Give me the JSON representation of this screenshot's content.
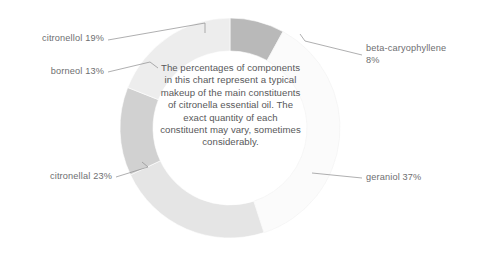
{
  "chart_data": {
    "type": "pie",
    "variant": "donut",
    "title": "",
    "subtitle": "",
    "xlabel": "",
    "ylabel": "",
    "legend_position": "callout-labels",
    "grid": false,
    "units": "%",
    "total": 100,
    "categories": [
      "beta-caryophyllene",
      "geraniol",
      "citronellal",
      "borneol",
      "citronellol"
    ],
    "values": [
      8,
      37,
      23,
      13,
      19
    ],
    "slices": [
      {
        "name": "beta-caryophyllene",
        "value": 8,
        "label": "beta-caryophyllene\n8%",
        "color": "#b9b9b9",
        "start_angle": 0,
        "end_angle": 28.8,
        "label_side": "right"
      },
      {
        "name": "geraniol",
        "value": 37,
        "label": "geraniol 37%",
        "color": "#fbfbfb",
        "start_angle": 28.8,
        "end_angle": 162,
        "label_side": "right"
      },
      {
        "name": "citronellal",
        "value": 23,
        "label": "citronellal 23%",
        "color": "#e5e5e5",
        "start_angle": 162,
        "end_angle": 244.8,
        "label_side": "left"
      },
      {
        "name": "borneol",
        "value": 13,
        "label": "borneol 13%",
        "color": "#d1d1d1",
        "start_angle": 244.8,
        "end_angle": 291.6,
        "label_side": "left"
      },
      {
        "name": "citronellol",
        "value": 19,
        "label": "citronellol 19%",
        "color": "#ededed",
        "start_angle": 291.6,
        "end_angle": 360,
        "label_side": "left"
      }
    ],
    "center_note": "The percentages of components in this chart represent a typical makeup of the main constituents of citronella essential oil. The exact quantity of each constituent may vary, sometimes considerably."
  },
  "colors": {
    "background": "#ffffff",
    "label_text": "#6e6e70",
    "center_text": "#58585a",
    "leader_line": "#8c8c8e"
  }
}
